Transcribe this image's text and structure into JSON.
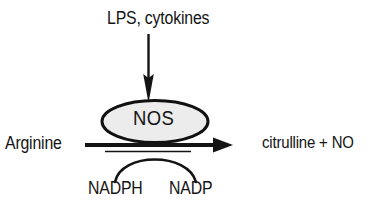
{
  "diagram": {
    "title_text": "LPS, cytokines",
    "enzyme_label": "NOS",
    "substrate_label": "Arginine",
    "product_label": "citrulline + NO",
    "cofactor_in_label": "NADPH",
    "cofactor_out_label": "NADP",
    "colors": {
      "background": "#ffffff",
      "ink": "#141414",
      "enzyme_fill": "#ececec",
      "enzyme_stroke": "#111111"
    }
  }
}
